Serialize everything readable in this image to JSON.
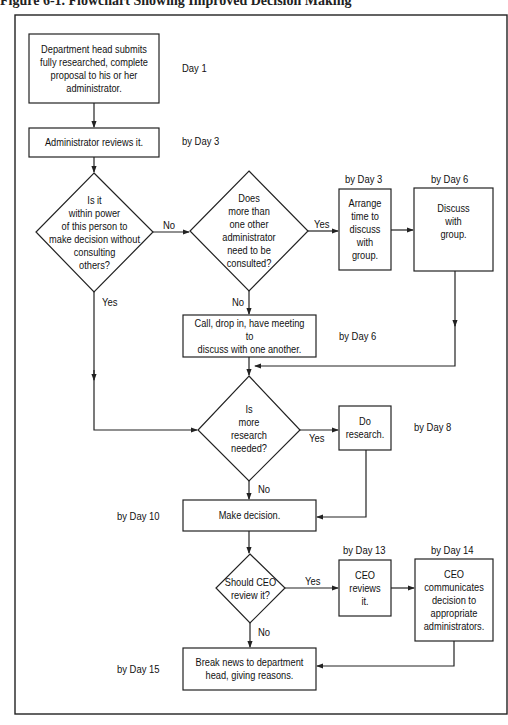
{
  "figure": {
    "title": "Figure 6-1. Flowchart Showing Improved Decision Making"
  },
  "nodes": {
    "submit": "Department head submits fully researched, complete proposal to his or her administrator.",
    "review": "Administrator reviews it.",
    "q_power": "Is it within power of this person to make decision without consulting others?",
    "q_more_admins": "Does more than one other administrator need to be consulted?",
    "arrange": "Arrange time to discuss with group.",
    "discuss_group": "Discuss with group.",
    "call": "Call, drop in, have meeting to discuss with one another.",
    "q_research": "Is more research needed?",
    "do_research": "Do research.",
    "make_decision": "Make decision.",
    "q_ceo": "Should CEO review it?",
    "ceo_reviews": "CEO reviews it.",
    "ceo_communicates": "CEO communicates decision to appropriate administrators.",
    "break_news": "Break news to department head, giving reasons."
  },
  "node_lines": {
    "submit": [
      "Department head submits",
      "fully researched, complete",
      "proposal to his or her",
      "administrator."
    ],
    "q_power": [
      "Is it",
      "within power",
      "of this person to",
      "make decision without",
      "consulting",
      "others?"
    ],
    "q_more_admins": [
      "Does",
      "more than",
      "one other",
      "administrator",
      "need to be",
      "consulted?"
    ],
    "arrange": [
      "Arrange",
      "time to",
      "discuss",
      "with",
      "group."
    ],
    "discuss_group": [
      "Discuss",
      "with",
      "group."
    ],
    "call": [
      "Call, drop in, have meeting to",
      "discuss with one another."
    ],
    "q_research": [
      "Is",
      "more",
      "research",
      "needed?"
    ],
    "do_research": [
      "Do",
      "research."
    ],
    "q_ceo": [
      "Should CEO",
      "review it?"
    ],
    "ceo_reviews": [
      "CEO",
      "reviews",
      "it."
    ],
    "ceo_communicates": [
      "CEO",
      "communicates",
      "decision to",
      "appropriate",
      "administrators."
    ],
    "break_news": [
      "Break news to department",
      "head, giving reasons."
    ]
  },
  "timeline": {
    "submit": "Day 1",
    "review": "by Day 3",
    "arrange": "by Day 3",
    "discuss_group": "by Day 6",
    "call": "by Day 6",
    "do_research": "by Day 8",
    "make_decision": "by Day 10",
    "ceo_reviews": "by Day 13",
    "ceo_communicates": "by Day 14",
    "break_news": "by Day 15"
  },
  "edges": {
    "power_no": "No",
    "power_yes": "Yes",
    "admins_yes": "Yes",
    "admins_no": "No",
    "research_yes": "Yes",
    "research_no": "No",
    "ceo_yes": "Yes",
    "ceo_no": "No"
  },
  "style": {
    "line_color": "#222222",
    "background": "#ffffff"
  }
}
